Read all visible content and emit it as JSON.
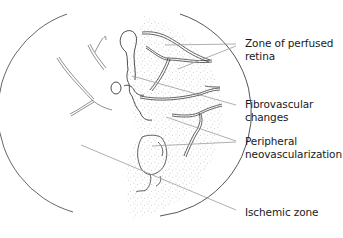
{
  "figure": {
    "colors": {
      "line": "#2a2a2a",
      "leader": "#9a9a9a",
      "stipple": "#8c8c8c",
      "background": "#ffffff"
    },
    "labels": [
      {
        "id": "zone-of-perfused-retina",
        "lines": [
          "Zone of perfused",
          "retina"
        ]
      },
      {
        "id": "fibrovascular-changes",
        "lines": [
          "Fibrovascular",
          "changes"
        ]
      },
      {
        "id": "peripheral-neovascularization",
        "lines": [
          "Peripheral",
          "neovascularization"
        ]
      },
      {
        "id": "ischemic-zone",
        "lines": [
          "Ischemic zone"
        ]
      }
    ]
  }
}
